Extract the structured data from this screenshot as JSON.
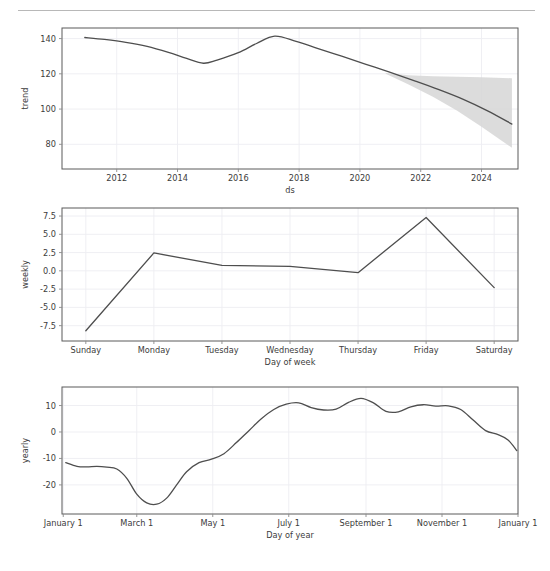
{
  "page": {
    "background": "#ffffff",
    "rule_color": "#b8b8b8",
    "line_color": "#4e4e4e",
    "band_color": "#d6d6d6",
    "grid_color": "#ededf2",
    "spine_color": "#5a5a5a",
    "text_color": "#3c3c3c"
  },
  "chart_data": [
    {
      "type": "line",
      "name": "trend-panel",
      "title": "",
      "xlabel": "ds",
      "ylabel": "trend",
      "grid": true,
      "legend": "none",
      "xlim": [
        2010.2,
        2025.2
      ],
      "ylim": [
        66,
        146
      ],
      "xticks": [
        2012,
        2014,
        2016,
        2018,
        2020,
        2022,
        2024
      ],
      "xticklabels": [
        "2012",
        "2014",
        "2016",
        "2018",
        "2020",
        "2022",
        "2024"
      ],
      "yticks": [
        80,
        100,
        120,
        140
      ],
      "yticklabels": [
        "80",
        "100",
        "120",
        "140"
      ],
      "series": [
        {
          "name": "trend",
          "x": [
            2010.95,
            2011.6,
            2012.3,
            2013.0,
            2013.7,
            2014.3,
            2014.85,
            2015.3,
            2016.0,
            2016.6,
            2017.2,
            2017.9,
            2018.6,
            2019.4,
            2020.2,
            2021.0,
            2021.8,
            2022.6,
            2023.4,
            2024.2,
            2025.0
          ],
          "y": [
            140.6,
            139.5,
            137.9,
            135.6,
            132.2,
            128.7,
            126.0,
            127.8,
            132.0,
            137.2,
            141.4,
            138.4,
            134.5,
            130.0,
            125.4,
            120.8,
            116.0,
            111.0,
            105.5,
            99.0,
            91.5
          ]
        }
      ],
      "uncertainty_band": {
        "x": [
          2020.85,
          2021.6,
          2022.4,
          2023.2,
          2024.0,
          2025.0
        ],
        "upper": [
          120.5,
          119.2,
          118.6,
          118.3,
          118.0,
          117.5
        ],
        "lower": [
          120.0,
          114.0,
          107.0,
          99.0,
          90.0,
          78.0
        ]
      }
    },
    {
      "type": "line",
      "name": "weekly-panel",
      "title": "",
      "xlabel": "Day of week",
      "ylabel": "weekly",
      "grid": true,
      "legend": "none",
      "xlim": [
        -0.35,
        6.35
      ],
      "ylim": [
        -9.6,
        8.6
      ],
      "categories": [
        "Sunday",
        "Monday",
        "Tuesday",
        "Wednesday",
        "Thursday",
        "Friday",
        "Saturday"
      ],
      "yticks": [
        -7.5,
        -5.0,
        -2.5,
        0.0,
        2.5,
        5.0,
        7.5
      ],
      "yticklabels": [
        "-7.5",
        "-5.0",
        "-2.5",
        "0.0",
        "2.5",
        "5.0",
        "7.5"
      ],
      "series": [
        {
          "name": "weekly",
          "x": [
            0,
            1,
            2,
            3,
            4,
            5,
            6
          ],
          "y": [
            -8.2,
            2.45,
            0.75,
            0.6,
            -0.25,
            7.3,
            -2.3
          ]
        }
      ]
    },
    {
      "type": "line",
      "name": "yearly-panel",
      "title": "",
      "xlabel": "Day of year",
      "ylabel": "yearly",
      "grid": true,
      "legend": "none",
      "xlim": [
        0,
        366
      ],
      "ylim": [
        -31,
        17
      ],
      "xticks": [
        1,
        60,
        121,
        182,
        244,
        305,
        366
      ],
      "xticklabels": [
        "January 1",
        "March 1",
        "May 1",
        "July 1",
        "September 1",
        "November 1",
        "January 1"
      ],
      "yticks": [
        -20,
        -10,
        0,
        10
      ],
      "yticklabels": [
        "-20",
        "-10",
        "0",
        "10"
      ],
      "series": [
        {
          "name": "yearly",
          "x": [
            3,
            12,
            20,
            28,
            36,
            44,
            52,
            60,
            68,
            76,
            84,
            92,
            100,
            110,
            120,
            130,
            140,
            150,
            160,
            170,
            180,
            190,
            200,
            210,
            220,
            230,
            240,
            250,
            260,
            270,
            280,
            290,
            300,
            310,
            320,
            330,
            340,
            350,
            358,
            365
          ],
          "y": [
            -11.6,
            -13.0,
            -13.2,
            -13.0,
            -13.3,
            -14.0,
            -17.5,
            -23.5,
            -26.8,
            -27.3,
            -25.0,
            -20.0,
            -15.0,
            -11.6,
            -10.3,
            -8.2,
            -4.0,
            0.5,
            5.0,
            8.5,
            10.5,
            11.0,
            9.2,
            8.3,
            8.6,
            11.2,
            12.7,
            11.0,
            7.8,
            7.6,
            9.5,
            10.3,
            9.8,
            9.9,
            8.5,
            4.5,
            0.5,
            -1.0,
            -3.0,
            -7.0,
            -10.8
          ]
        }
      ]
    }
  ]
}
